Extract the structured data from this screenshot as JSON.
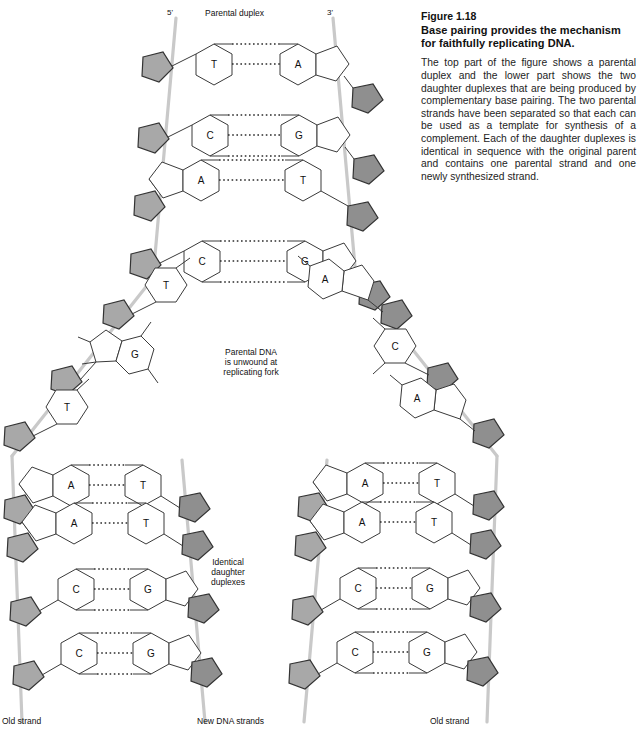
{
  "caption": {
    "figure_number": "Figure 1.18",
    "title": "Base pairing provides the mechanism for faithfully replicating DNA.",
    "body": "The top part of the figure shows a parental duplex and the lower part shows the two daughter duplexes that are being produced by complementary base pairing. The two parental strands have been separated so that each can be used as a template for synthesis of a complement. Each of the daughter duplexes is identical in sequence with the original parent and contains one parental strand and one newly synthesized strand."
  },
  "diagram": {
    "labels": {
      "parental_duplex": "Parental duplex",
      "five_prime": "5'",
      "three_prime": "3'",
      "replicating_fork": "Parental DNA\nis unwound at\nreplicating fork",
      "identical_duplexes": "Identical\ndaughter\nduplexes",
      "old_strand_left": "Old strand",
      "new_dna_strands": "New DNA strands",
      "old_strand_right": "Old strand"
    },
    "colors": {
      "backbone_line": "#c9c9c9",
      "sugar_fill": "#a8a8a8",
      "sugar_fill_dark": "#8f8f8f",
      "base_outline": "#3a3a3a",
      "hydrogen_bond": "#2b2b2b",
      "background": "#ffffff",
      "text": "#111111"
    },
    "parental_duplex": {
      "strand_left_label": "5'",
      "strand_right_label": "3'",
      "base_pairs": [
        {
          "left": "T",
          "right": "A",
          "bonds": 2
        },
        {
          "left": "C",
          "right": "G",
          "bonds": 3
        },
        {
          "left": "A",
          "right": "T",
          "bonds": 2
        },
        {
          "left": "C",
          "right": "G",
          "bonds": 3
        }
      ]
    },
    "fork_unwound": {
      "left_strand_bases": [
        "T",
        "G",
        "T"
      ],
      "right_strand_bases": [
        "A",
        "C",
        "A"
      ]
    },
    "daughter_duplex_left": {
      "base_pairs": [
        {
          "left": "A",
          "right": "T",
          "bonds": 2
        },
        {
          "left": "A",
          "right": "T",
          "bonds": 2
        },
        {
          "left": "C",
          "right": "G",
          "bonds": 3
        },
        {
          "left": "C",
          "right": "G",
          "bonds": 3
        }
      ]
    },
    "daughter_duplex_right": {
      "base_pairs": [
        {
          "left": "A",
          "right": "T",
          "bonds": 2
        },
        {
          "left": "A",
          "right": "T",
          "bonds": 2
        },
        {
          "left": "C",
          "right": "G",
          "bonds": 3
        },
        {
          "left": "C",
          "right": "G",
          "bonds": 3
        }
      ]
    }
  }
}
